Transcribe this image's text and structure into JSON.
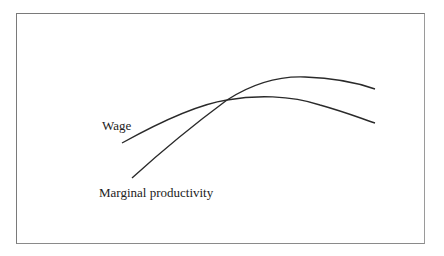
{
  "diagram": {
    "type": "curve-comparison",
    "curves": [
      {
        "name": "Wage",
        "label": "Wage",
        "path": "M122,143 C160,122 200,104 227,100 C255,95 290,95 320,105 C345,112 360,118 375,123",
        "stroke": "#2a2a2a"
      },
      {
        "name": "Marginal productivity",
        "label": "Marginal productivity",
        "path": "M132,178 C165,148 200,120 227,100 C255,82 280,76 305,77 C335,78 358,83 375,89",
        "stroke": "#2a2a2a"
      }
    ],
    "frame_color": "#7a7a7a",
    "background": "#ffffff"
  }
}
